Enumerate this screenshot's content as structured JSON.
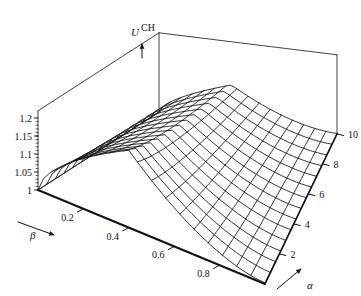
{
  "figure": {
    "type": "surface-3d-wireframe",
    "background": "#ffffff",
    "line_color": "#111111",
    "width": 361,
    "height": 296
  },
  "chart_data": {
    "type": "line",
    "plot_kind": "3d-surface-mesh",
    "title": "",
    "xlabel": "β",
    "ylabel": "α",
    "zlabel": "U",
    "zlabel_superscript": "CH",
    "xlim": [
      0,
      1
    ],
    "ylim": [
      0,
      10
    ],
    "zlim": [
      1,
      1.22
    ],
    "grid": true,
    "legend": "none",
    "x_ticks": [
      0.2,
      0.4,
      0.6,
      0.8
    ],
    "x_tick_labels": [
      "0.2",
      "0.4",
      "0.6",
      "0.8"
    ],
    "y_ticks": [
      2,
      4,
      6,
      8,
      10
    ],
    "y_tick_labels": [
      "2",
      "4",
      "6",
      "8",
      "10"
    ],
    "z_ticks": [
      1,
      1.05,
      1.1,
      1.15,
      1.2
    ],
    "z_tick_labels": [
      "1",
      "1.05",
      "1.1",
      "1.15",
      "1.2"
    ],
    "mesh": {
      "nx": 16,
      "ny": 14
    },
    "surface_model": {
      "description": "U^CH(beta,alpha) ridge: rises steeply from beta=0, peaks near beta~0.40 at low alpha, decays with alpha",
      "z_base": 1.0,
      "amplitude": 0.215,
      "beta_peak": 0.4,
      "beta_rise_exp": 0.62,
      "beta_fall_exp": 1.75,
      "alpha_decay": 0.115,
      "alpha_peak_shift": 0.016
    }
  },
  "annotations": {
    "z_axis_label_text": "U",
    "z_axis_label_sup": "CH",
    "beta_axis_label": "β",
    "alpha_axis_label": "α",
    "z_arrow": "up-arrow",
    "beta_arrow": "down-right-arrow",
    "alpha_arrow": "up-right-arrow"
  }
}
